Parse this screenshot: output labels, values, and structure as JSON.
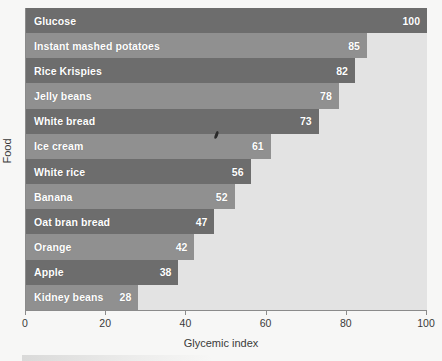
{
  "chart_data": {
    "type": "bar",
    "orientation": "horizontal",
    "title": "",
    "xlabel": "Glycemic index",
    "ylabel": "Food",
    "xlim": [
      0,
      100
    ],
    "xticks": [
      0,
      20,
      40,
      60,
      80,
      100
    ],
    "grid": false,
    "legend": null,
    "categories": [
      "Glucose",
      "Instant mashed potatoes",
      "Rice Krispies",
      "Jelly beans",
      "White bread",
      "Ice cream",
      "White rice",
      "Banana",
      "Oat bran bread",
      "Orange",
      "Apple",
      "Kidney beans"
    ],
    "values": [
      100,
      85,
      82,
      78,
      73,
      61,
      56,
      52,
      47,
      42,
      38,
      28
    ],
    "bar_shades": [
      "dark",
      "light",
      "dark",
      "light",
      "dark",
      "light",
      "dark",
      "light",
      "dark",
      "light",
      "dark",
      "light"
    ]
  },
  "colors": {
    "bar_dark": "#6d6d6d",
    "bar_light": "#909090",
    "plot_background": "#e3e3e3",
    "page_background": "#f7f7f6",
    "axis": "#8b8b8b",
    "value_text": "#ffffff",
    "axis_text": "#3a3a3a"
  }
}
